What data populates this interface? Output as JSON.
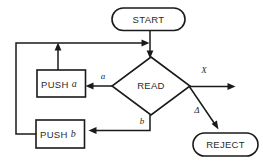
{
  "diagram": {
    "type": "flowchart",
    "background_color": "#ffffff",
    "line_color": "#1a1a1a",
    "text_color": "#2b2b2b",
    "nodes": [
      {
        "id": "start",
        "label": "START",
        "shape": "stadium"
      },
      {
        "id": "read",
        "label": "READ",
        "shape": "diamond"
      },
      {
        "id": "push_a",
        "label_main": "PUSH",
        "label_italic": "a",
        "shape": "rectangle"
      },
      {
        "id": "push_b",
        "label_main": "PUSH",
        "label_italic": "b",
        "shape": "rectangle"
      },
      {
        "id": "reject",
        "label": "REJECT",
        "shape": "stadium"
      }
    ],
    "edge_labels": {
      "branch_a": "a",
      "branch_b": "b",
      "branch_x": "X",
      "branch_delta": "Δ"
    }
  }
}
